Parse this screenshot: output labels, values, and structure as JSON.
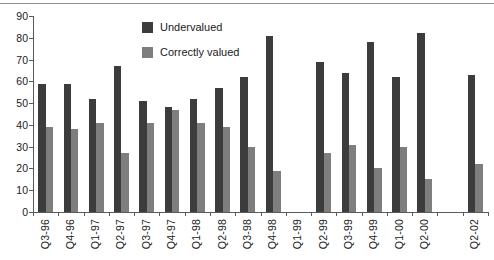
{
  "chart_data": {
    "type": "bar",
    "title": "",
    "subtitle": "",
    "xlabel": "",
    "ylabel": "",
    "ylim": [
      0,
      90
    ],
    "yticks": [
      0,
      10,
      20,
      30,
      40,
      50,
      60,
      70,
      80,
      90
    ],
    "grid": false,
    "legend_position": "top-center",
    "categories": [
      "Q3-96",
      "Q4-96",
      "Q1-97",
      "Q2-97",
      "Q3-97",
      "Q4-97",
      "Q1-98",
      "Q2-98",
      "Q3-98",
      "Q4-98",
      "Q1-99",
      "Q2-99",
      "Q3-99",
      "Q4-99",
      "Q1-00",
      "Q2-00",
      "",
      "Q2-02"
    ],
    "series": [
      {
        "name": "Undervalued",
        "color": "#3c3c3c",
        "values": [
          59,
          59,
          52,
          67,
          51,
          48,
          52,
          57,
          62,
          81,
          null,
          69,
          64,
          78,
          62,
          82,
          null,
          63
        ]
      },
      {
        "name": "Correctly valued",
        "color": "#7e7e7e",
        "values": [
          39,
          38,
          41,
          27,
          41,
          47,
          41,
          39,
          30,
          19,
          null,
          27,
          31,
          20,
          30,
          15,
          null,
          22
        ]
      }
    ]
  },
  "legend": {
    "items": [
      {
        "label": "Undervalued",
        "color": "#3c3c3c"
      },
      {
        "label": "Correctly valued",
        "color": "#7e7e7e"
      }
    ]
  }
}
